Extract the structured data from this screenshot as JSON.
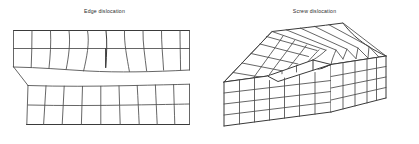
{
  "figure": {
    "title_left": "Edge dislocation",
    "title_right": "Screw dislocation",
    "line_color": "#4a4a4a",
    "background_color": "#ffffff",
    "text_color": "#2b2b2b"
  },
  "panels": [
    {
      "id": "edge",
      "caption": "Edge dislocation",
      "diagram_type": "2d-lattice-cross-section",
      "description": "Two-dimensional crystal lattice grid containing an extra half-plane of atoms that terminates part-way down, producing curved lattice planes around the dislocation core",
      "columns": 9,
      "rows": 5,
      "extra_half_plane": true,
      "core_row_index": 2
    },
    {
      "id": "screw",
      "caption": "Screw dislocation",
      "diagram_type": "3d-isometric-block",
      "description": "Isometric crystal block whose top surface is sheared into a spiral ramp; a step runs from the front edge toward the centre where the screw dislocation line emerges",
      "top_cols": 7,
      "top_rows": 5,
      "front_rows": 4,
      "front_cols": 7,
      "side_cols": 5,
      "step": true
    }
  ]
}
